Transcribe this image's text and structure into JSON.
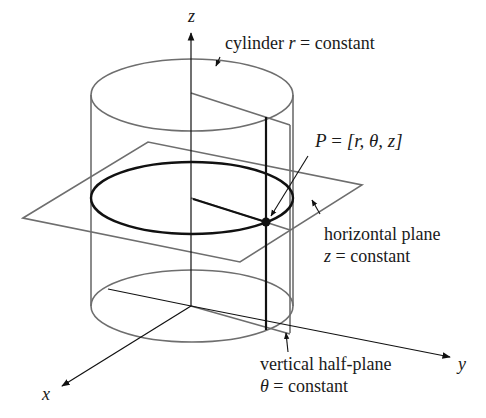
{
  "colors": {
    "background": "#ffffff",
    "thin_line": "#6e6e6e",
    "thick_line": "#111111",
    "text": "#1a1a1a"
  },
  "axes": {
    "z_label": "z",
    "y_label": "y",
    "x_label": "x"
  },
  "labels": {
    "cylinder": {
      "word": "cylinder",
      "var": "r",
      "rest": "= constant"
    },
    "point": {
      "name": "P",
      "eq": "=",
      "coords": "[r, θ, z]"
    },
    "horizontal_plane": {
      "line1": "horizontal plane",
      "var": "z",
      "rest": "= constant"
    },
    "vertical_half_plane": {
      "line1": "vertical half-plane",
      "var": "θ",
      "rest": "= constant"
    }
  }
}
